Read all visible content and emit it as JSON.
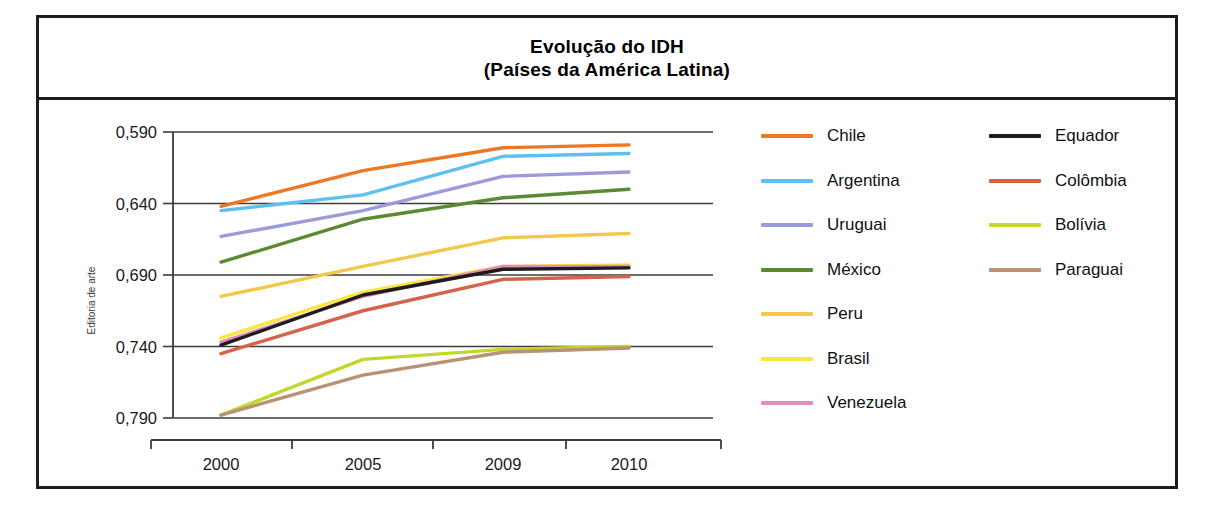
{
  "credit": "Editoria de arte",
  "title": {
    "line1": "Evolução do IDH",
    "line2": "(Países da América Latina)"
  },
  "axes": {
    "y_ticks": [
      "0,790",
      "0,740",
      "0,690",
      "0,640",
      "0,590"
    ],
    "x_ticks": [
      "2000",
      "2005",
      "2009",
      "2010"
    ]
  },
  "legend": {
    "left": [
      {
        "label": "Chile",
        "color": "#ee7724"
      },
      {
        "label": "Argentina",
        "color": "#5ec0ef"
      },
      {
        "label": "Uruguai",
        "color": "#9b9bdc"
      },
      {
        "label": "México",
        "color": "#5c8a33"
      },
      {
        "label": "Peru",
        "color": "#f2c74a"
      },
      {
        "label": "Brasil",
        "color": "#fbe63f"
      },
      {
        "label": "Venezuela",
        "color": "#e38bbb"
      }
    ],
    "right": [
      {
        "label": "Equador",
        "color": "#1d1d1d"
      },
      {
        "label": "Colômbia",
        "color": "#d4634a"
      },
      {
        "label": "Bolívia",
        "color": "#c3d62e"
      },
      {
        "label": "Paraguai",
        "color": "#b99274"
      }
    ]
  },
  "chart_data": {
    "type": "line",
    "title": "Evolução do IDH (Países da América Latina)",
    "xlabel": "",
    "ylabel": "",
    "x": [
      "2000",
      "2005",
      "2009",
      "2010"
    ],
    "ylim": [
      0.59,
      0.79
    ],
    "yticks": [
      0.59,
      0.64,
      0.69,
      0.74,
      0.79
    ],
    "grid": true,
    "legend_position": "right",
    "series": [
      {
        "name": "Chile",
        "color": "#ee7724",
        "values": [
          0.738,
          0.763,
          0.779,
          0.781
        ]
      },
      {
        "name": "Argentina",
        "color": "#5ec0ef",
        "values": [
          0.735,
          0.746,
          0.773,
          0.775
        ]
      },
      {
        "name": "Uruguai",
        "color": "#9b9bdc",
        "values": [
          0.717,
          0.735,
          0.759,
          0.762
        ]
      },
      {
        "name": "México",
        "color": "#5c8a33",
        "values": [
          0.699,
          0.729,
          0.744,
          0.75
        ]
      },
      {
        "name": "Peru",
        "color": "#f2c74a",
        "values": [
          0.675,
          0.696,
          0.716,
          0.719
        ]
      },
      {
        "name": "Brasil",
        "color": "#fbe63f",
        "values": [
          0.646,
          0.678,
          0.696,
          0.697
        ]
      },
      {
        "name": "Venezuela",
        "color": "#e38bbb",
        "values": [
          0.643,
          0.675,
          0.696,
          0.696
        ]
      },
      {
        "name": "Equador",
        "color": "#1d1d1d",
        "values": [
          0.641,
          0.676,
          0.694,
          0.695
        ]
      },
      {
        "name": "Colômbia",
        "color": "#d4634a",
        "values": [
          0.635,
          0.665,
          0.687,
          0.689
        ]
      },
      {
        "name": "Bolívia",
        "color": "#c3d62e",
        "values": [
          0.592,
          0.631,
          0.638,
          0.64
        ]
      },
      {
        "name": "Paraguai",
        "color": "#b99274",
        "values": [
          0.592,
          0.62,
          0.636,
          0.639
        ]
      }
    ]
  }
}
